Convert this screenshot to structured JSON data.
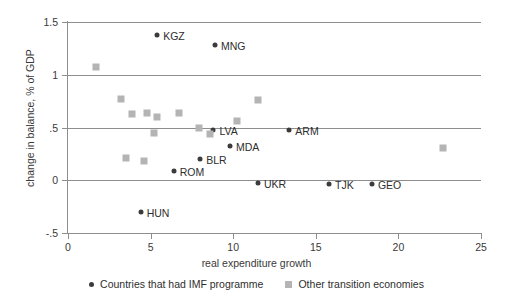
{
  "chart_data": {
    "type": "scatter",
    "title": "",
    "xlabel": "real expenditure growth",
    "ylabel": "change in balance, % of GDP",
    "xlim": [
      0,
      25
    ],
    "ylim": [
      -0.5,
      1.5
    ],
    "xticks": [
      "0",
      "5",
      "10",
      "15",
      "20",
      "25"
    ],
    "xtick_values": [
      0,
      5,
      10,
      15,
      20,
      25
    ],
    "yticks": [
      "-.5",
      "0",
      ".5",
      "1",
      "1.5"
    ],
    "ytick_values": [
      -0.5,
      0,
      0.5,
      1,
      1.5
    ],
    "grid": "horizontal",
    "legend_position": "bottom",
    "series": [
      {
        "name": "Countries that had IMF programme",
        "marker": "circle",
        "color": "#3b3b3b",
        "points": [
          {
            "label": "KGZ",
            "x": 5.4,
            "y": 1.38,
            "label_side": "right"
          },
          {
            "label": "MNG",
            "x": 8.9,
            "y": 1.28,
            "label_side": "right"
          },
          {
            "label": "LVA",
            "x": 8.8,
            "y": 0.48,
            "label_side": "right"
          },
          {
            "label": "MDA",
            "x": 9.8,
            "y": 0.32,
            "label_side": "right"
          },
          {
            "label": "BLR",
            "x": 8.0,
            "y": 0.2,
            "label_side": "right"
          },
          {
            "label": "ROM",
            "x": 6.4,
            "y": 0.09,
            "label_side": "right"
          },
          {
            "label": "ARM",
            "x": 13.4,
            "y": 0.48,
            "label_side": "right"
          },
          {
            "label": "UKR",
            "x": 11.5,
            "y": -0.03,
            "label_side": "right"
          },
          {
            "label": "TJK",
            "x": 15.8,
            "y": -0.04,
            "label_side": "right"
          },
          {
            "label": "GEO",
            "x": 18.4,
            "y": -0.04,
            "label_side": "right"
          },
          {
            "label": "HUN",
            "x": 4.4,
            "y": -0.3,
            "label_side": "right"
          }
        ]
      },
      {
        "name": "Other transition economies",
        "marker": "square",
        "color": "#b4b4b4",
        "points": [
          {
            "label": "",
            "x": 1.7,
            "y": 1.07
          },
          {
            "label": "",
            "x": 3.2,
            "y": 0.77
          },
          {
            "label": "",
            "x": 3.9,
            "y": 0.63
          },
          {
            "label": "",
            "x": 4.8,
            "y": 0.64
          },
          {
            "label": "",
            "x": 5.4,
            "y": 0.6
          },
          {
            "label": "",
            "x": 5.2,
            "y": 0.445
          },
          {
            "label": "",
            "x": 3.5,
            "y": 0.215
          },
          {
            "label": "",
            "x": 4.6,
            "y": 0.185
          },
          {
            "label": "",
            "x": 6.7,
            "y": 0.635
          },
          {
            "label": "",
            "x": 7.9,
            "y": 0.5
          },
          {
            "label": "",
            "x": 8.6,
            "y": 0.435
          },
          {
            "label": "",
            "x": 10.2,
            "y": 0.565
          },
          {
            "label": "",
            "x": 11.5,
            "y": 0.765
          },
          {
            "label": "",
            "x": 22.7,
            "y": 0.31
          }
        ]
      }
    ]
  },
  "legend": {
    "entries": [
      {
        "label": "Countries that had IMF programme",
        "marker": "circle"
      },
      {
        "label": "Other transition economies",
        "marker": "square"
      }
    ]
  }
}
